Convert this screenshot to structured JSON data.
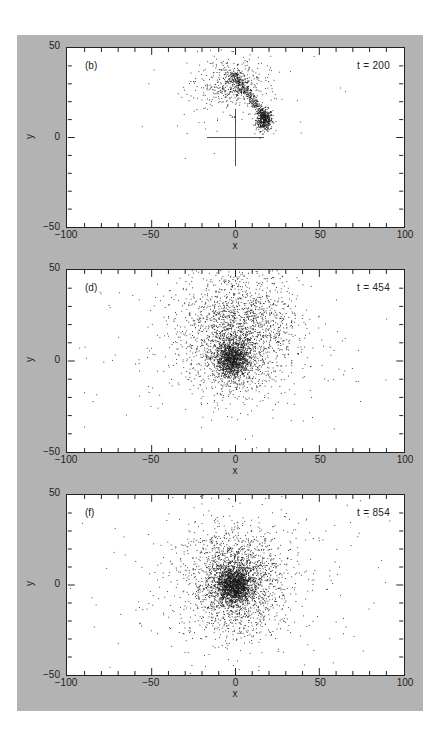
{
  "figure": {
    "background_color": "#b3b3b3",
    "x_axis": {
      "label": "x",
      "min": -100,
      "max": 100,
      "tick_labels": [
        "−100",
        "−50",
        "0",
        "50",
        "100"
      ],
      "tick_values": [
        -100,
        -50,
        0,
        50,
        100
      ],
      "minor_step": 10
    },
    "y_axis": {
      "label": "y",
      "min": -50,
      "max": 50,
      "tick_labels": [
        "50",
        "0",
        "−50"
      ],
      "tick_values": [
        50,
        0,
        -50
      ],
      "minor_step": 10
    }
  },
  "panels": [
    {
      "letter": "(b)",
      "time": "t = 200",
      "top": 47,
      "height": 181,
      "crosshair": true
    },
    {
      "letter": "(d)",
      "time": "t = 454",
      "top": 269,
      "height": 184,
      "crosshair": false
    },
    {
      "letter": "(f)",
      "time": "t = 854",
      "top": 494,
      "height": 182,
      "crosshair": false
    }
  ],
  "chart_data": [
    {
      "type": "scatter",
      "title": "(b) t = 200",
      "xlabel": "x",
      "ylabel": "y",
      "xlim": [
        -100,
        100
      ],
      "ylim": [
        -50,
        50
      ],
      "grid": false,
      "annotations": [
        "(b)",
        "t = 200",
        "crosshair at origin (x: -17..17, y: -16..16)"
      ],
      "clusters": [
        {
          "name": "core",
          "cx": 17,
          "cy": 10,
          "sx": 2.5,
          "sy": 3,
          "n": 450
        },
        {
          "name": "tidal-tail",
          "x0": 17,
          "y0": 12,
          "x1": -2,
          "y1": 36,
          "spread": 2.5,
          "n": 350
        },
        {
          "name": "debris-arc",
          "cx": -3,
          "cy": 30,
          "sx": 10,
          "sy": 7,
          "n": 450
        },
        {
          "name": "halo",
          "cx": 0,
          "cy": 25,
          "sx": 25,
          "sy": 15,
          "n": 60
        }
      ]
    },
    {
      "type": "scatter",
      "title": "(d) t = 454",
      "xlabel": "x",
      "ylabel": "y",
      "xlim": [
        -100,
        100
      ],
      "ylim": [
        -50,
        50
      ],
      "grid": false,
      "annotations": [
        "(d)",
        "t = 454"
      ],
      "clusters": [
        {
          "name": "core",
          "cx": -2,
          "cy": 1,
          "sx": 5,
          "sy": 5,
          "n": 1200
        },
        {
          "name": "inner-envelope",
          "cx": 0,
          "cy": 8,
          "sx": 15,
          "sy": 14,
          "n": 1100
        },
        {
          "name": "outer-plume",
          "cx": 2,
          "cy": 25,
          "sx": 18,
          "sy": 16,
          "n": 900
        },
        {
          "name": "halo",
          "cx": -10,
          "cy": 5,
          "sx": 40,
          "sy": 25,
          "n": 250
        }
      ]
    },
    {
      "type": "scatter",
      "title": "(f) t = 854",
      "xlabel": "x",
      "ylabel": "y",
      "xlim": [
        -100,
        100
      ],
      "ylim": [
        -50,
        50
      ],
      "grid": false,
      "annotations": [
        "(f)",
        "t = 854"
      ],
      "clusters": [
        {
          "name": "core",
          "cx": -1,
          "cy": 0,
          "sx": 5,
          "sy": 5,
          "n": 1400
        },
        {
          "name": "envelope",
          "cx": 0,
          "cy": 2,
          "sx": 13,
          "sy": 13,
          "n": 1500
        },
        {
          "name": "outer-shell",
          "cx": 0,
          "cy": 3,
          "sx": 22,
          "sy": 20,
          "n": 600
        },
        {
          "name": "halo",
          "cx": 0,
          "cy": 0,
          "sx": 50,
          "sy": 28,
          "n": 200
        }
      ]
    }
  ]
}
